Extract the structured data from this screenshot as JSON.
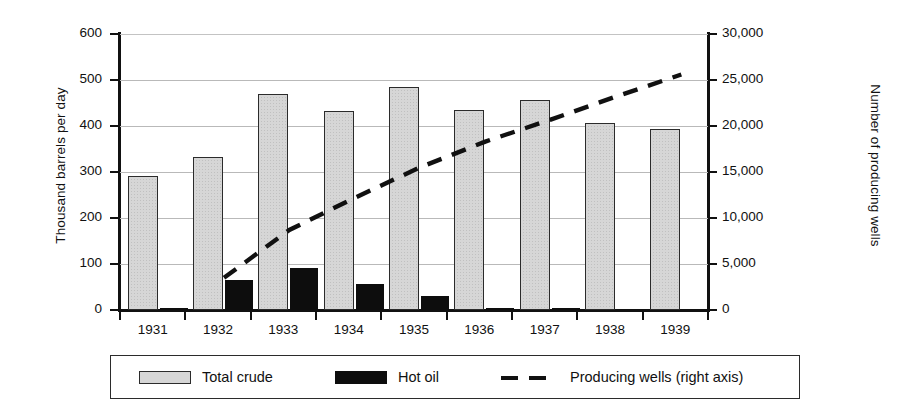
{
  "chart_data": {
    "type": "bar",
    "title": "",
    "xlabel": "",
    "ylabel": "Thousand barrels per day",
    "y2label": "Number of producing wells",
    "categories": [
      "1931",
      "1932",
      "1933",
      "1934",
      "1935",
      "1936",
      "1937",
      "1938",
      "1939"
    ],
    "ylim": [
      0,
      600
    ],
    "y2lim": [
      0,
      30000
    ],
    "yticks": [
      0,
      100,
      200,
      300,
      400,
      500,
      600
    ],
    "ytick_labels": [
      "0",
      "100",
      "200",
      "300",
      "400",
      "500",
      "600"
    ],
    "y2ticks": [
      0,
      5000,
      10000,
      15000,
      20000,
      25000,
      30000
    ],
    "y2tick_labels": [
      "0",
      "5,000",
      "10,000",
      "15,000",
      "20,000",
      "25,000",
      "30,000"
    ],
    "grid": true,
    "legend_position": "bottom",
    "series": [
      {
        "name": "Total crude",
        "type": "bar",
        "axis": "left",
        "color": "#d6d6d6",
        "edge_color": "#2b2b2b",
        "values": [
          292,
          332,
          470,
          433,
          484,
          435,
          457,
          406,
          393
        ]
      },
      {
        "name": "Hot oil",
        "type": "bar",
        "axis": "left",
        "color": "#0d0d0d",
        "edge_color": "#0d0d0d",
        "values": [
          4,
          66,
          92,
          57,
          30,
          5,
          1,
          0,
          0
        ]
      },
      {
        "name": "Producing wells (right axis)",
        "type": "line",
        "axis": "right",
        "color": "#111111",
        "linestyle": "dashed",
        "x": [
          "1932",
          "1933",
          "1934",
          "1935",
          "1936",
          "1937",
          "1938",
          "1939"
        ],
        "values": [
          3500,
          8700,
          12200,
          15500,
          18300,
          20700,
          23200,
          25600
        ]
      }
    ]
  },
  "legend": {
    "items": [
      {
        "label": "Total crude",
        "marker": "bar-light"
      },
      {
        "label": "Hot oil",
        "marker": "bar-dark"
      },
      {
        "label": "Producing wells (right axis)",
        "marker": "dashed-line"
      }
    ]
  }
}
